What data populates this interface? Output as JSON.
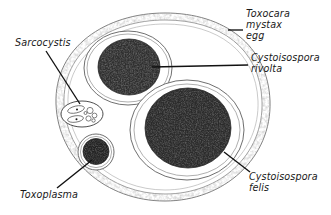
{
  "figure": {
    "background_color": "#ffffff",
    "ink_color": "#1a1a1a",
    "width": 331,
    "height": 215
  },
  "labels": {
    "toxocara": {
      "lines": [
        "Toxocara",
        "mystax",
        "egg"
      ],
      "line1": "Toxocara",
      "line2": "mystax",
      "line3": "egg",
      "full": "Toxocara mystax egg",
      "position": "top-right",
      "leader": "horizontal-dash-left"
    },
    "rivolta": {
      "lines": [
        "Cystoisospora",
        "rivolta"
      ],
      "line1": "Cystoisospora",
      "line2": "rivolta",
      "full": "Cystoisospora rivolta",
      "position": "right-upper",
      "leader": "horizontal-line-left"
    },
    "felis": {
      "lines": [
        "Cystoisospora",
        "felis"
      ],
      "line1": "Cystoisospora",
      "line2": "felis",
      "full": "Cystoisospora felis",
      "position": "bottom-right",
      "leader": "diagonal-up-left"
    },
    "sarcocystis": {
      "lines": [
        "Sarcocystis"
      ],
      "line1": "Sarcocystis",
      "full": "Sarcocystis",
      "position": "top-left",
      "leader": "diagonal-down-right"
    },
    "toxoplasma": {
      "lines": [
        "Toxoplasma"
      ],
      "line1": "Toxoplasma",
      "full": "Toxoplasma",
      "position": "bottom-left",
      "leader": "diagonal-up-right"
    }
  },
  "structures": {
    "toxocara_egg": {
      "name": "Toxocara mystax egg shell",
      "shape": "large-stippled-oval",
      "fill": "#ffffff",
      "stroke": "#6f6f6f"
    },
    "cystoisospora_rivolta": {
      "name": "Cystoisospora rivolta oocyst",
      "shape": "oval-with-dark-sporont",
      "sporont_fill": "#2a2a2a"
    },
    "cystoisospora_felis": {
      "name": "Cystoisospora felis oocyst",
      "shape": "large-oval-with-dark-sporont",
      "sporont_fill": "#262626"
    },
    "sarcocystis_cyst": {
      "name": "Sarcocystis sporocyst",
      "shape": "small-oval-with-bradyzoites",
      "fill": "#ffffff"
    },
    "toxoplasma_oocyst": {
      "name": "Toxoplasma oocyst",
      "shape": "small-circle-with-dark-sporont",
      "sporont_fill": "#1f1f1f"
    }
  }
}
